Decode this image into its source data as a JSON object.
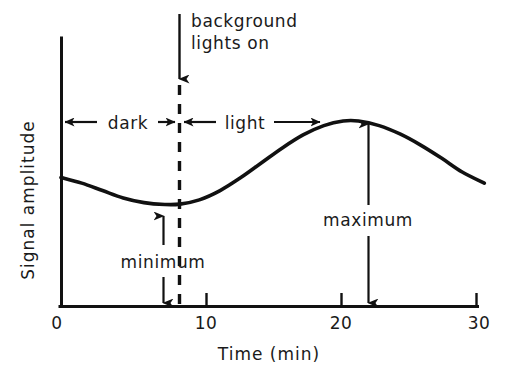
{
  "chart_data": {
    "type": "line",
    "title": "",
    "xlabel": "Time  (min)",
    "ylabel": "Signal  amplitude",
    "xlim": [
      0,
      30
    ],
    "ylim": [
      0,
      1
    ],
    "grid": false,
    "legend": null,
    "xticks": [
      0,
      10,
      20,
      30
    ],
    "xtick_labels": [
      "0",
      "10",
      "20",
      "30"
    ],
    "yticks": [],
    "ytick_labels": [],
    "series": [
      {
        "name": "signal amplitude",
        "x": [
          0,
          1.5,
          3,
          4.5,
          6,
          7.5,
          8.6,
          10,
          11.5,
          13,
          14.5,
          16,
          17.5,
          19,
          20.4,
          21.5,
          23,
          24.5,
          26,
          27.5,
          29,
          30.6
        ],
        "y": [
          0.695,
          0.665,
          0.625,
          0.585,
          0.56,
          0.55,
          0.552,
          0.575,
          0.625,
          0.695,
          0.775,
          0.855,
          0.925,
          0.975,
          1.0,
          1.0,
          0.975,
          0.93,
          0.87,
          0.8,
          0.725,
          0.665
        ]
      }
    ],
    "annotations": [
      {
        "name": "background-lights-on",
        "label": "background\nlights  on",
        "label_lines": [
          "background",
          "lights  on"
        ],
        "arrow": "down",
        "x": 8.5,
        "event_time": 8.5
      },
      {
        "name": "dark-interval",
        "label": "dark",
        "arrow": "double",
        "x_start": 0,
        "x_end": 8.5
      },
      {
        "name": "light-interval",
        "label": "light",
        "arrow": "double",
        "x_start": 8.5,
        "x_end": 18.8
      },
      {
        "name": "minimum-marker",
        "label": "minimum",
        "x": 7.4,
        "arrow": "double-vertical"
      },
      {
        "name": "maximum-marker",
        "label": "maximum",
        "x": 21.2,
        "arrow": "double-vertical"
      }
    ],
    "event_line": {
      "name": "background-lights-on-line",
      "style": "dashed",
      "x": 8.5
    },
    "colors": {
      "curve": "#111111",
      "axis": "#111111",
      "text": "#1a1a1a",
      "background": "#ffffff"
    }
  },
  "axes": {
    "x_title": "Time  (min)",
    "y_title": "Signal  amplitude",
    "tick_labels": {
      "t0": "0",
      "t10": "10",
      "t20": "20",
      "t30": "30"
    }
  },
  "labels": {
    "background_line1": "background",
    "background_line2": "lights  on",
    "dark": "dark",
    "light": "light",
    "minimum": "minimum",
    "maximum": "maximum"
  }
}
